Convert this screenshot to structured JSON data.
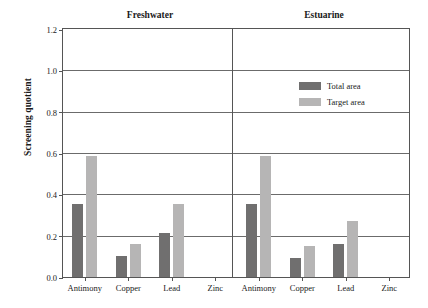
{
  "chart_data": {
    "type": "bar",
    "title": "",
    "xlabel": "",
    "ylabel": "Screening quotient",
    "ylim": [
      0.0,
      1.2
    ],
    "yticks": [
      "0.0",
      "0.2",
      "0.4",
      "0.6",
      "0.8",
      "1.0",
      "1.2"
    ],
    "ytick_values": [
      0.0,
      0.2,
      0.4,
      0.6,
      0.8,
      1.0,
      1.2
    ],
    "grid": "horizontal",
    "legend_position": "upper-right-inside",
    "categories": [
      "Antimony",
      "Copper",
      "Lead",
      "Zinc"
    ],
    "panels": [
      {
        "name": "Freshwater",
        "series": [
          {
            "name": "Total area",
            "color": "#706f6f",
            "values": [
              0.35,
              0.1,
              0.21,
              0.0
            ]
          },
          {
            "name": "Target area",
            "color": "#b6b5b5",
            "values": [
              0.58,
              0.16,
              0.35,
              0.0
            ]
          }
        ]
      },
      {
        "name": "Estuarine",
        "series": [
          {
            "name": "Total area",
            "color": "#706f6f",
            "values": [
              0.35,
              0.09,
              0.16,
              0.0
            ]
          },
          {
            "name": "Target area",
            "color": "#b6b5b5",
            "values": [
              0.58,
              0.15,
              0.27,
              0.0
            ]
          }
        ]
      }
    ],
    "legend": [
      {
        "label": "Total area",
        "color": "#706f6f"
      },
      {
        "label": "Target area",
        "color": "#b6b5b5"
      }
    ]
  },
  "colors": {
    "total_area": "#706f6f",
    "target_area": "#b6b5b5",
    "axis": "#555555",
    "gridline": "#6b6b6b",
    "background": "#ffffff"
  }
}
